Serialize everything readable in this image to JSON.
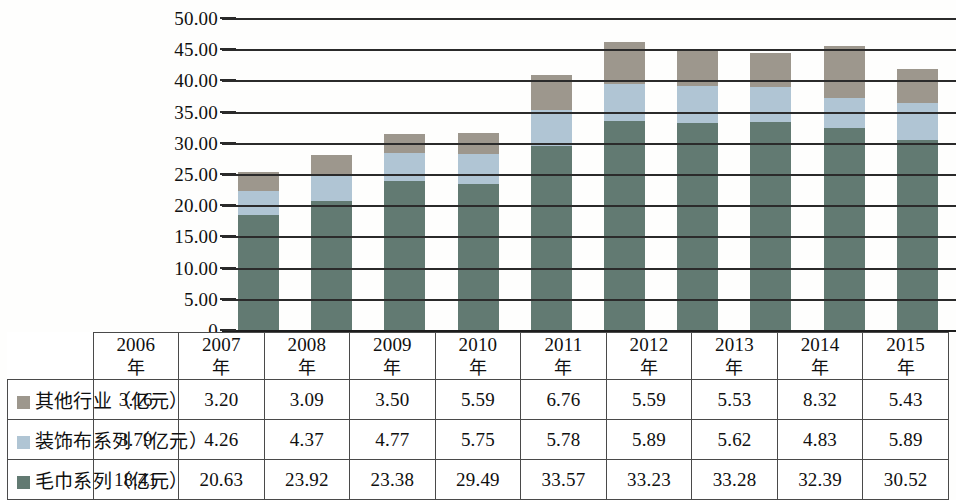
{
  "chart_data": {
    "type": "bar",
    "subtype": "stacked-column",
    "categories": [
      "2006年",
      "2007年",
      "2008年",
      "2009年",
      "2010年",
      "2011年",
      "2012年",
      "2013年",
      "2014年",
      "2015年"
    ],
    "series": [
      {
        "name": "毛巾系列（亿元）",
        "color": "#627a72",
        "values": [
          18.41,
          20.63,
          23.92,
          23.38,
          29.49,
          33.57,
          33.23,
          33.28,
          32.39,
          30.52
        ]
      },
      {
        "name": "装饰布系列（亿元）",
        "color": "#b0c5d4",
        "values": [
          3.79,
          4.26,
          4.37,
          4.77,
          5.75,
          5.78,
          5.89,
          5.62,
          4.83,
          5.89
        ]
      },
      {
        "name": "其他行业（亿元）",
        "color": "#9d978d",
        "values": [
          3.16,
          3.2,
          3.09,
          3.5,
          5.59,
          6.76,
          5.59,
          5.53,
          8.32,
          5.43
        ]
      }
    ],
    "totals": [
      25.36,
      28.09,
      31.38,
      31.65,
      40.83,
      46.11,
      44.71,
      44.43,
      45.54,
      41.84
    ],
    "title": "",
    "xlabel": "",
    "ylabel": "",
    "ylim": [
      0,
      50
    ],
    "ytick_labels": [
      "0",
      "5.00",
      "10.00",
      "15.00",
      "20.00",
      "25.00",
      "30.00",
      "35.00",
      "40.00",
      "45.00",
      "50.00"
    ],
    "ytick_values": [
      0,
      5,
      10,
      15,
      20,
      25,
      30,
      35,
      40,
      45,
      50
    ],
    "grid": true,
    "legend_position": "table-row-labels"
  },
  "table": {
    "year_row": [
      {
        "year": "2006",
        "suffix": "年"
      },
      {
        "year": "2007",
        "suffix": "年"
      },
      {
        "year": "2008",
        "suffix": "年"
      },
      {
        "year": "2009",
        "suffix": "年"
      },
      {
        "year": "2010",
        "suffix": "年"
      },
      {
        "year": "2011",
        "suffix": "年"
      },
      {
        "year": "2012",
        "suffix": "年"
      },
      {
        "year": "2013",
        "suffix": "年"
      },
      {
        "year": "2014",
        "suffix": "年"
      },
      {
        "year": "2015",
        "suffix": "年"
      }
    ],
    "rows": [
      {
        "label": "其他行业（亿元）",
        "swatch": "other",
        "values": [
          "3.16",
          "3.20",
          "3.09",
          "3.50",
          "5.59",
          "6.76",
          "5.59",
          "5.53",
          "8.32",
          "5.43"
        ]
      },
      {
        "label": "装饰布系列（亿元）",
        "swatch": "decor",
        "values": [
          "3.79",
          "4.26",
          "4.37",
          "4.77",
          "5.75",
          "5.78",
          "5.89",
          "5.62",
          "4.83",
          "5.89"
        ]
      },
      {
        "label": "毛巾系列（亿元）",
        "swatch": "towel",
        "values": [
          "18.41",
          "20.63",
          "23.92",
          "23.38",
          "29.49",
          "33.57",
          "33.23",
          "33.28",
          "32.39",
          "30.52"
        ]
      }
    ]
  },
  "colors": {
    "towel": "#627a72",
    "decor": "#b0c5d4",
    "other": "#9d978d",
    "gridline": "#2b2b2b",
    "background": "#fefefd"
  }
}
